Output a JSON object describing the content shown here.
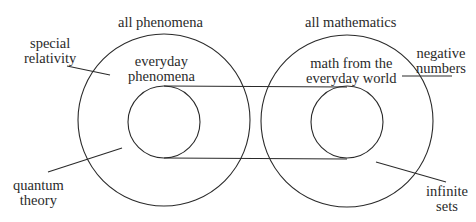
{
  "diagram": {
    "colors": {
      "stroke": "#2a2a2a",
      "text": "#2a2a2a",
      "background": "#ffffff"
    },
    "left": {
      "outer_label": "all phenomena",
      "inner_label_line1": "everyday",
      "inner_label_line2": "phenomena",
      "annotations": [
        {
          "line1": "special",
          "line2": "relativity"
        },
        {
          "line1": "quantum",
          "line2": "theory"
        }
      ]
    },
    "right": {
      "outer_label": "all mathematics",
      "inner_label_line1": "math from the",
      "inner_label_line2": "everyday world",
      "annotations": [
        {
          "line1": "negative",
          "line2": "numbers"
        },
        {
          "line1": "infinite",
          "line2": "sets"
        }
      ]
    }
  }
}
